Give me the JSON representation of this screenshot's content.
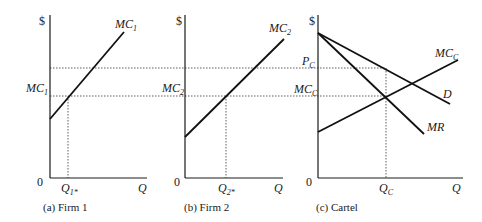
{
  "figure": {
    "panels": [
      {
        "id": "firm1",
        "caption": "(a) Firm 1",
        "y_axis_label": "$",
        "origin_label": "0",
        "x_axis_label": "Q",
        "curve_label": {
          "main": "MC",
          "sub": "1"
        },
        "y_tick_label": {
          "main": "MC",
          "sub": "1"
        },
        "x_tick_label": {
          "main": "Q",
          "sub": "1*"
        }
      },
      {
        "id": "firm2",
        "caption": "(b) Firm 2",
        "y_axis_label": "$",
        "origin_label": "0",
        "x_axis_label": "Q",
        "curve_label": {
          "main": "MC",
          "sub": "2"
        },
        "y_tick_label": {
          "main": "MC",
          "sub": "2"
        },
        "x_tick_label": {
          "main": "Q",
          "sub": "2*"
        }
      },
      {
        "id": "cartel",
        "caption": "(c) Cartel",
        "y_axis_label": "$",
        "origin_label": "0",
        "x_axis_label": "Q",
        "curves": {
          "mc": {
            "main": "MC",
            "sub": "C"
          },
          "demand": "D",
          "mr": "MR"
        },
        "y_tick_labels": {
          "price": {
            "main": "P",
            "sub": "C"
          },
          "mc": {
            "main": "MC",
            "sub": "C"
          }
        },
        "x_tick_label": {
          "main": "Q",
          "sub": "C"
        }
      }
    ],
    "colors": {
      "line": "#111111",
      "background": "#ffffff"
    }
  }
}
